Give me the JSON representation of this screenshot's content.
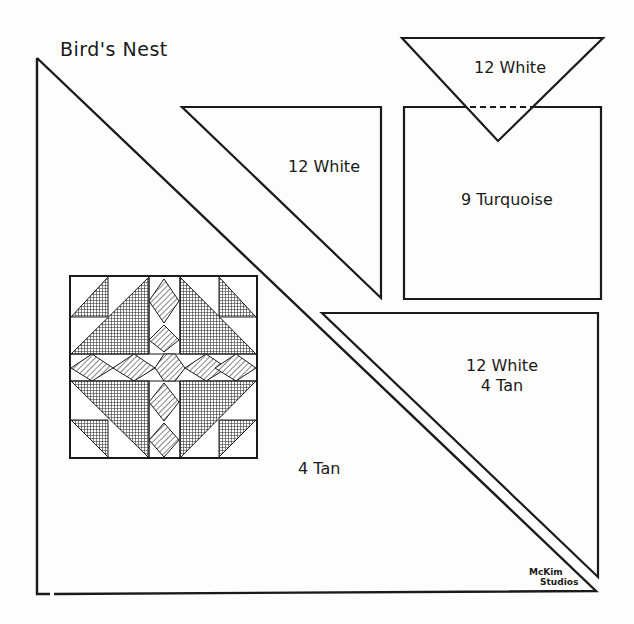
{
  "title": "Bird's Nest",
  "pieces": [
    {
      "id": "top-inverted-triangle",
      "label": "12 White"
    },
    {
      "id": "upper-middle-triangle",
      "label": "12 White"
    },
    {
      "id": "square",
      "label": "9 Turquoise"
    },
    {
      "id": "lower-right-triangle",
      "label_line1": "12 White",
      "label_line2": "4 Tan"
    },
    {
      "id": "large-left-triangle",
      "label": "4 Tan"
    }
  ],
  "credit": {
    "line1": "McKim",
    "line2": "Studios"
  },
  "colors": {
    "ink": "#1a1a1a",
    "paper": "#fdfdfb"
  }
}
